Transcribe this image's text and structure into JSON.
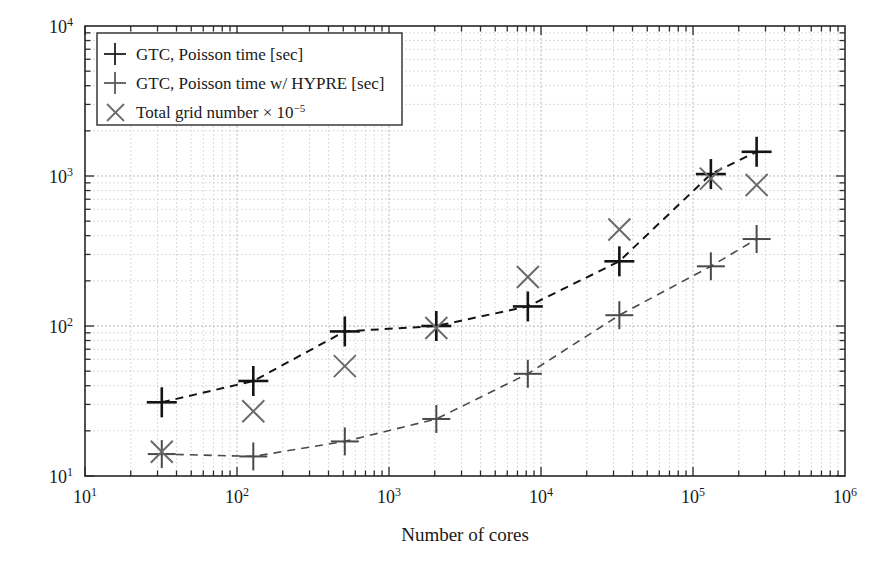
{
  "chart_data": {
    "type": "line",
    "title": "",
    "xlabel": "Number of cores",
    "ylabel": "",
    "xscale": "log",
    "yscale": "log",
    "xlim": [
      10,
      1000000
    ],
    "ylim": [
      10,
      10000
    ],
    "grid": true,
    "grid_style": "dotted minor and major",
    "legend_position": "top-left inside",
    "x_tick_labels": [
      "10¹",
      "10²",
      "10³",
      "10⁴",
      "10⁵",
      "10⁶"
    ],
    "x_tick_values": [
      10,
      100,
      1000,
      10000,
      100000,
      1000000
    ],
    "y_tick_labels": [
      "10¹",
      "10²",
      "10³",
      "10⁴"
    ],
    "y_tick_values": [
      10,
      100,
      1000,
      10000
    ],
    "x": [
      32,
      128,
      512,
      2048,
      8192,
      32768,
      131072,
      262144
    ],
    "series": [
      {
        "name": "GTC, Poisson time [sec]",
        "marker": "plus",
        "color": "#141414",
        "linestyle": "dashed",
        "values": [
          31,
          43,
          92,
          100,
          135,
          270,
          1030,
          1450
        ]
      },
      {
        "name": "GTC, Poisson time w/ HYPRE [sec]",
        "marker": "plus",
        "color": "#4a4a4a",
        "linestyle": "dashed",
        "values": [
          14,
          13.5,
          17,
          24,
          48,
          118,
          250,
          380
        ]
      },
      {
        "name": "Total grid number × 10⁻⁵",
        "marker": "cross",
        "color": "#6b6b6b",
        "linestyle": "none",
        "values": [
          14.5,
          27,
          54,
          97,
          212,
          440,
          960,
          870
        ]
      }
    ]
  },
  "legend": {
    "entries": [
      {
        "label": "GTC, Poisson time [sec]",
        "marker": "plus-icon"
      },
      {
        "label": "GTC, Poisson time w/ HYPRE [sec]",
        "marker": "plus-icon"
      },
      {
        "label": "Total grid number ",
        "marker": "cross-icon",
        "suffix_base": "× 10",
        "suffix_exp": "−5"
      }
    ]
  },
  "axes": {
    "x_title": "Number of cores"
  }
}
